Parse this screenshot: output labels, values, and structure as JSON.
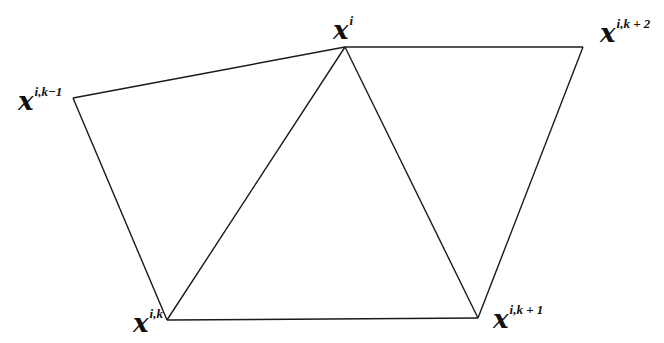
{
  "diagram": {
    "type": "mesh-patch",
    "vertices": [
      {
        "id": "xi_km1",
        "base": "x",
        "sup": "i,k−1",
        "x": 73,
        "y": 98,
        "label_x": 18,
        "label_y": 88
      },
      {
        "id": "xi",
        "base": "x",
        "sup": "i",
        "x": 345,
        "y": 47,
        "label_x": 333,
        "label_y": 17
      },
      {
        "id": "xi_kp2",
        "base": "x",
        "sup": "i,k + 2",
        "x": 583,
        "y": 47,
        "label_x": 600,
        "label_y": 20
      },
      {
        "id": "xi_k",
        "base": "x",
        "sup": "i,k",
        "x": 167,
        "y": 320,
        "label_x": 133,
        "label_y": 310
      },
      {
        "id": "xi_kp1",
        "base": "x",
        "sup": "i,k + 1",
        "x": 478,
        "y": 318,
        "label_x": 493,
        "label_y": 306
      }
    ],
    "edges": [
      [
        "xi_km1",
        "xi"
      ],
      [
        "xi",
        "xi_kp2"
      ],
      [
        "xi_km1",
        "xi_k"
      ],
      [
        "xi_k",
        "xi"
      ],
      [
        "xi",
        "xi_kp1"
      ],
      [
        "xi_kp2",
        "xi_kp1"
      ],
      [
        "xi_k",
        "xi_kp1"
      ]
    ],
    "labels": {
      "xi_km1": {
        "base": "x",
        "sup": "i,k−1"
      },
      "xi": {
        "base": "x",
        "sup": "i"
      },
      "xi_kp2": {
        "base": "x",
        "sup": "i,k + 2"
      },
      "xi_k": {
        "base": "x",
        "sup": "i,k"
      },
      "xi_kp1": {
        "base": "x",
        "sup": "i,k + 1"
      }
    }
  }
}
